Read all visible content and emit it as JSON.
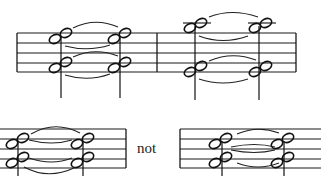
{
  "figure": {
    "top_example": {
      "measures": 2,
      "staff_lines": 5
    },
    "bottom_examples": [
      {
        "label": "correct"
      },
      {
        "label": "incorrect"
      }
    ],
    "separator_text": "not"
  },
  "colors": {
    "ink": "#111111",
    "background": "#ffffff"
  }
}
